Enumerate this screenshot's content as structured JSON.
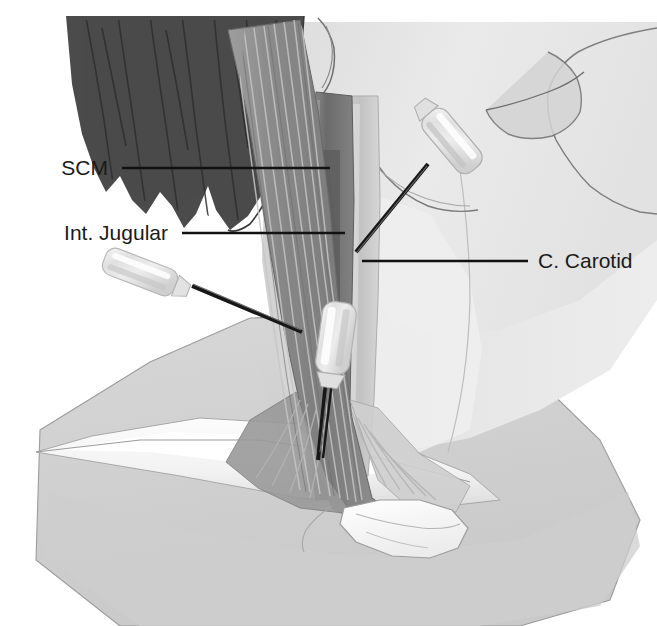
{
  "figure": {
    "background_color": "#ffffff",
    "width": 657,
    "height": 626
  },
  "labels": [
    {
      "id": "scm",
      "text": "SCM",
      "text_x": 108,
      "text_y": 168,
      "anchor": "end",
      "line_x1": 122,
      "line_y1": 168,
      "line_x2": 330,
      "line_y2": 168
    },
    {
      "id": "internal-jugular",
      "text": "Int. Jugular",
      "text_x": 168,
      "text_y": 233,
      "anchor": "end",
      "line_x1": 182,
      "line_y1": 233,
      "line_x2": 345,
      "line_y2": 233
    },
    {
      "id": "common-carotid",
      "text": "C. Carotid",
      "text_x": 538,
      "text_y": 261,
      "anchor": "start",
      "line_x1": 528,
      "line_y1": 261,
      "line_x2": 362,
      "line_y2": 261
    }
  ],
  "anatomy": {
    "structures": [
      {
        "name": "hair",
        "label": "Hair / scalp",
        "color": "#4a4a4a"
      },
      {
        "name": "face-skin",
        "label": "Face and neck skin",
        "color": "#e9e9e9"
      },
      {
        "name": "sternocleidomastoid",
        "label": "Sternocleidomastoid muscle",
        "color": "#8e8e8e"
      },
      {
        "name": "internal-jugular-vein",
        "label": "Internal jugular vein",
        "color": "#6f6f6f"
      },
      {
        "name": "common-carotid-artery",
        "label": "Common carotid artery",
        "color": "#c6c6c6"
      },
      {
        "name": "clavicle",
        "label": "Clavicle",
        "color": "#fbfbfb"
      },
      {
        "name": "drape",
        "label": "Surgical drape",
        "color": "#d9d9d9"
      }
    ]
  },
  "devices": [
    {
      "id": "needle-superior",
      "label": "Superior approach needle and catheter hub",
      "hub_color": "#e3e3e3",
      "needle_color": "#171717",
      "entry_x": 424,
      "entry_y": 168,
      "tip_x": 356,
      "tip_y": 252
    },
    {
      "id": "needle-lateral",
      "label": "Lateral approach needle and catheter hub",
      "hub_color": "#e3e3e3",
      "needle_color": "#171717",
      "entry_x": 196,
      "entry_y": 288,
      "tip_x": 300,
      "tip_y": 331
    },
    {
      "id": "needle-central",
      "label": "Central approach needle and catheter hub",
      "hub_color": "#e3e3e3",
      "needle_color": "#171717",
      "entry_x": 327,
      "entry_y": 365,
      "tip_x": 320,
      "tip_y": 458
    }
  ]
}
